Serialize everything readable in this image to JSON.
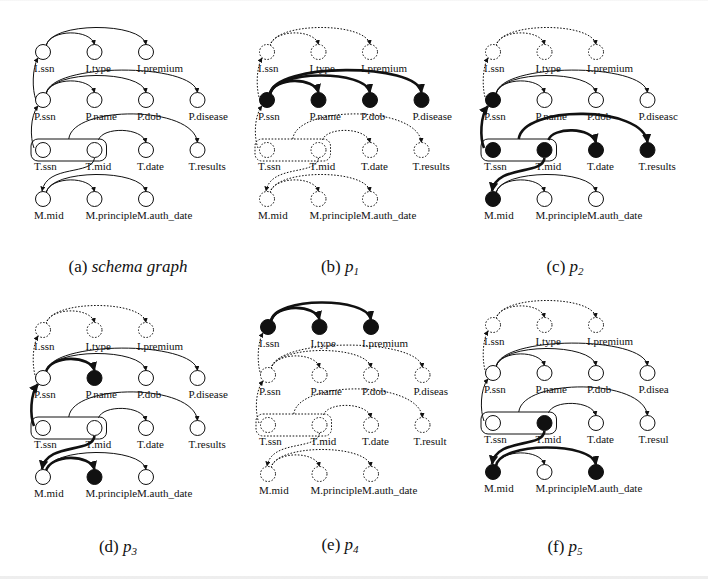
{
  "figure": {
    "column_spacing": 51.5,
    "row_offsets": {
      "I": 0,
      "P": 48,
      "T": 98,
      "M": 147
    },
    "columns": {
      "I": [
        "I.ssn",
        "I.type",
        "I.premium"
      ],
      "P": [
        "P.ssn",
        "P.name",
        "P.dob",
        "P.disease"
      ],
      "T": [
        "T.ssn",
        "T.mid",
        "T.date",
        "T.results"
      ],
      "M": [
        "M.mid",
        "M.principle",
        "M.auth_date"
      ]
    },
    "edges": [
      {
        "id": "I.ssn-I.type",
        "from": "I.ssn",
        "to": "I.type"
      },
      {
        "id": "I.ssn-I.premium",
        "from": "I.ssn",
        "to": "I.premium"
      },
      {
        "id": "P.ssn-I.ssn",
        "from": "P.ssn",
        "to": "I.ssn",
        "kind": "vertical"
      },
      {
        "id": "P.ssn-P.name",
        "from": "P.ssn",
        "to": "P.name"
      },
      {
        "id": "P.ssn-P.dob",
        "from": "P.ssn",
        "to": "P.dob"
      },
      {
        "id": "P.ssn-P.disease",
        "from": "P.ssn",
        "to": "P.disease"
      },
      {
        "id": "T.ssn-P.ssn",
        "from": "T.ssn",
        "to": "P.ssn",
        "kind": "vertical"
      },
      {
        "id": "T-T.date",
        "from": "T.mid",
        "to": "T.date"
      },
      {
        "id": "T-T.results",
        "from": "T.key",
        "to": "T.results"
      },
      {
        "id": "T.mid-M.mid",
        "from": "T.mid",
        "to": "M.mid",
        "kind": "s-curve"
      },
      {
        "id": "M.mid-M.principle",
        "from": "M.mid",
        "to": "M.principle"
      },
      {
        "id": "M.mid-M.auth_date",
        "from": "M.mid",
        "to": "M.auth_date"
      }
    ],
    "panels": [
      {
        "id": "a",
        "x": 43,
        "y": 52,
        "caption_prefix": "(a) ",
        "caption_main": "schema graph",
        "caption_sub": "",
        "caption_x": 128,
        "caption_y": 272,
        "filled": [],
        "dotted_nodes": [],
        "bold_edges": [],
        "dotted_edges": [],
        "label_overrides": {}
      },
      {
        "id": "b",
        "x": 267,
        "y": 52,
        "caption_prefix": "(b) ",
        "caption_main": "p",
        "caption_sub": "1",
        "caption_x": 340,
        "caption_y": 272,
        "filled": [
          "P.ssn",
          "P.name",
          "P.dob",
          "P.disease"
        ],
        "dotted_nodes": [
          "I.ssn",
          "I.type",
          "I.premium",
          "T.ssn",
          "T.mid",
          "T.date",
          "T.results",
          "M.mid",
          "M.principle",
          "M.auth_date"
        ],
        "bold_edges": [
          "P.ssn-P.name",
          "P.ssn-P.dob",
          "P.ssn-P.disease"
        ],
        "dotted_edges": [
          "I.ssn-I.type",
          "I.ssn-I.premium",
          "P.ssn-I.ssn",
          "T.ssn-P.ssn",
          "T-T.date",
          "T-T.results",
          "T.mid-M.mid",
          "M.mid-M.principle",
          "M.mid-M.auth_date"
        ],
        "dotted_key_box": true,
        "label_overrides": {}
      },
      {
        "id": "c",
        "x": 493,
        "y": 52,
        "caption_prefix": "(c) ",
        "caption_main": "p",
        "caption_sub": "2",
        "caption_x": 565,
        "caption_y": 272,
        "filled": [
          "P.ssn",
          "T.ssn",
          "T.mid",
          "T.date",
          "T.results",
          "M.mid"
        ],
        "dotted_nodes": [
          "I.ssn",
          "I.type",
          "I.premium"
        ],
        "bold_edges": [
          "T.ssn-P.ssn",
          "T-T.date",
          "T-T.results",
          "T.mid-M.mid"
        ],
        "dotted_edges": [
          "I.ssn-I.type",
          "I.ssn-I.premium",
          "P.ssn-I.ssn"
        ],
        "label_overrides": {
          "P.disease": "P.diseasc"
        }
      },
      {
        "id": "d",
        "x": 43,
        "y": 330,
        "caption_prefix": "(d) ",
        "caption_main": "p",
        "caption_sub": "3",
        "caption_x": 118,
        "caption_y": 552,
        "filled": [
          "P.name",
          "M.principle"
        ],
        "dotted_nodes": [
          "I.ssn",
          "I.type",
          "I.premium"
        ],
        "bold_edges": [
          "P.ssn-P.name",
          "T.ssn-P.ssn",
          "T.mid-M.mid",
          "M.mid-M.principle"
        ],
        "dotted_edges": [
          "I.ssn-I.type",
          "I.ssn-I.premium",
          "P.ssn-I.ssn"
        ],
        "label_overrides": {}
      },
      {
        "id": "e",
        "x": 268,
        "y": 327,
        "caption_prefix": "(e) ",
        "caption_main": "p",
        "caption_sub": "4",
        "caption_x": 340,
        "caption_y": 550,
        "filled": [
          "I.ssn",
          "I.type",
          "I.premium"
        ],
        "dotted_nodes": [
          "P.ssn",
          "P.name",
          "P.dob",
          "P.disease",
          "T.ssn",
          "T.mid",
          "T.date",
          "T.results",
          "M.mid",
          "M.principle",
          "M.auth_date"
        ],
        "bold_edges": [
          "I.ssn-I.type",
          "I.ssn-I.premium"
        ],
        "dotted_edges": [
          "P.ssn-I.ssn",
          "P.ssn-P.name",
          "P.ssn-P.dob",
          "P.ssn-P.disease",
          "T.ssn-P.ssn",
          "T-T.date",
          "T-T.results",
          "T.mid-M.mid",
          "M.mid-M.principle",
          "M.mid-M.auth_date"
        ],
        "dotted_key_box": true,
        "label_overrides": {
          "P.disease": "P.diseas",
          "T.results": "T.result"
        }
      },
      {
        "id": "f",
        "x": 493,
        "y": 325,
        "caption_prefix": "(f) ",
        "caption_main": "p",
        "caption_sub": "5",
        "caption_x": 565,
        "caption_y": 552,
        "filled": [
          "T.mid",
          "M.mid",
          "M.auth_date"
        ],
        "dotted_nodes": [
          "I.ssn",
          "I.type",
          "I.premium"
        ],
        "bold_edges": [
          "T.mid-M.mid",
          "M.mid-M.auth_date"
        ],
        "dotted_edges": [
          "I.ssn-I.type",
          "I.ssn-I.premium",
          "P.ssn-I.ssn"
        ],
        "label_overrides": {
          "P.disease": "P.disea",
          "T.results": "T.resul"
        }
      }
    ]
  }
}
